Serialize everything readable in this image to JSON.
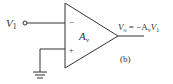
{
  "diagram": {
    "type": "inverting-op-amp",
    "input_label": "V",
    "input_sub": "1",
    "minus_sign": "−",
    "plus_sign": "+",
    "gain_label": "A",
    "gain_sub": "v",
    "output_label_v": "V",
    "output_sub": "o",
    "output_eq": " = −A",
    "output_eq_sub": "v",
    "output_eq_tail": "V",
    "output_eq_tail_sub": "1",
    "figure_label": "(b)",
    "stroke_color": "#333333"
  }
}
